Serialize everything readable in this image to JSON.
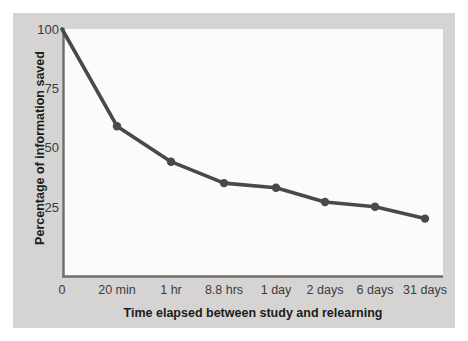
{
  "chart_data": {
    "type": "line",
    "title": "",
    "xlabel": "Time elapsed between study and relearning",
    "ylabel": "Percentage of information saved",
    "categories": [
      "0",
      "20 min",
      "1 hr",
      "8.8 hrs",
      "1 day",
      "2 days",
      "6 days",
      "31 days"
    ],
    "values": [
      100,
      59,
      44,
      35,
      33,
      27,
      25,
      20
    ],
    "series": [
      {
        "name": "Information saved",
        "values": [
          100,
          59,
          44,
          35,
          33,
          27,
          25,
          20
        ]
      }
    ],
    "ylim": [
      0,
      100
    ],
    "yticks": [
      25,
      50,
      75,
      100
    ],
    "ytick_labels": [
      "25",
      "50",
      "75",
      "100"
    ],
    "xtick_labels": [
      "0",
      "20 min",
      "1 hr",
      "8.8 hrs",
      "1 day",
      "2 days",
      "6 days",
      "31 days"
    ],
    "grid": false,
    "legend": "none",
    "line_color": "#4a4949",
    "marker_color": "#4a4949",
    "axis_color": "#6f6e6c",
    "panel_color": "#d5d4d2",
    "plot_background": "#fbfbfa",
    "page_background": "#ffffff",
    "text_color": "#3b3b3b",
    "title_color": "#1c1c1c"
  },
  "axis": {
    "y_title": "Percentage of information saved",
    "x_title": "Time elapsed between study and relearning",
    "y_labels": [
      {
        "text": "100",
        "top": 23
      },
      {
        "text": "75",
        "top": 82
      },
      {
        "text": "50",
        "top": 141
      },
      {
        "text": "25",
        "top": 201
      }
    ],
    "x_labels": [
      {
        "text": "0",
        "left": 62
      },
      {
        "text": "20 min",
        "left": 117
      },
      {
        "text": "1 hr",
        "left": 171
      },
      {
        "text": "8.8 hrs",
        "left": 224
      },
      {
        "text": "1 day",
        "left": 276
      },
      {
        "text": "2 days",
        "left": 325
      },
      {
        "text": "6 days",
        "left": 375
      },
      {
        "text": "31 days",
        "left": 425
      }
    ]
  }
}
